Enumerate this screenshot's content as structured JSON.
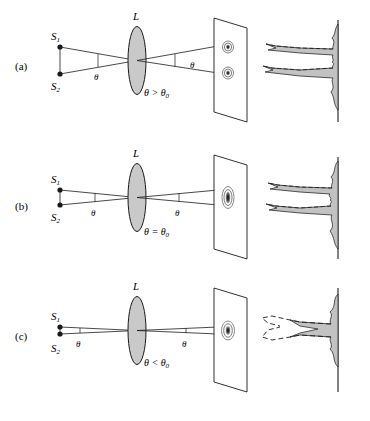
{
  "figure": {
    "background_color": "#ffffff",
    "ink_color": "#1a1a1a",
    "lens_fill": "#c9c9c9",
    "pattern_fill": "#c2c2c2"
  },
  "panels": [
    {
      "id": "a",
      "label": "(a)",
      "source_top_label": "S",
      "source_top_sub": "1",
      "source_bottom_label": "S",
      "source_bottom_sub": "2",
      "lens_label": "L",
      "angle_label_object": "θ",
      "angle_label_image": "θ",
      "condition": "θ > θ",
      "condition_sub": "0",
      "state": "resolved",
      "airy_disks": 2,
      "peaks": 2
    },
    {
      "id": "b",
      "label": "(b)",
      "source_top_label": "S",
      "source_top_sub": "1",
      "source_bottom_label": "S",
      "source_bottom_sub": "2",
      "lens_label": "L",
      "angle_label_object": "θ",
      "angle_label_image": "θ",
      "condition": "θ = θ",
      "condition_sub": "0",
      "state": "marginally-resolved",
      "airy_disks": 2,
      "peaks": 2
    },
    {
      "id": "c",
      "label": "(c)",
      "source_top_label": "S",
      "source_top_sub": "1",
      "source_bottom_label": "S",
      "source_bottom_sub": "2",
      "lens_label": "L",
      "angle_label_object": "θ",
      "angle_label_image": "θ",
      "condition": "θ < θ",
      "condition_sub": "0",
      "state": "unresolved",
      "airy_disks": 1,
      "peaks": 1
    }
  ]
}
